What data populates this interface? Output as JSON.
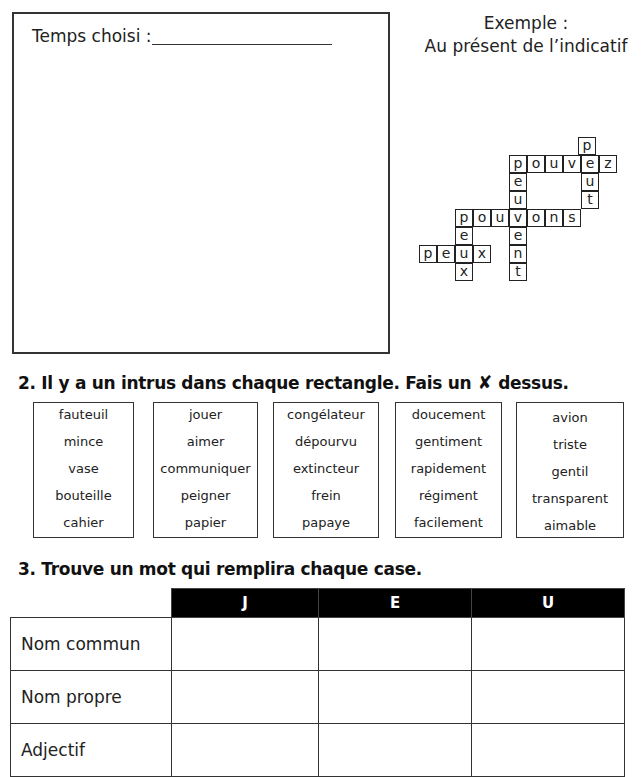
{
  "section1": {
    "tense_label": "Temps choisi :",
    "example_title": "Exemple :",
    "example_tense": "Au présent de l’indicatif",
    "crossword": {
      "cells": [
        {
          "x": 578,
          "y": 137,
          "ch": "p"
        },
        {
          "x": 509,
          "y": 155,
          "ch": "p"
        },
        {
          "x": 527,
          "y": 155,
          "ch": "o"
        },
        {
          "x": 545,
          "y": 155,
          "ch": "u"
        },
        {
          "x": 563,
          "y": 155,
          "ch": "v"
        },
        {
          "x": 581,
          "y": 155,
          "ch": "e"
        },
        {
          "x": 599,
          "y": 155,
          "ch": "z"
        },
        {
          "x": 509,
          "y": 173,
          "ch": "e"
        },
        {
          "x": 581,
          "y": 173,
          "ch": "u"
        },
        {
          "x": 509,
          "y": 191,
          "ch": "u"
        },
        {
          "x": 581,
          "y": 191,
          "ch": "t"
        },
        {
          "x": 455,
          "y": 209,
          "ch": "p"
        },
        {
          "x": 473,
          "y": 209,
          "ch": "o"
        },
        {
          "x": 491,
          "y": 209,
          "ch": "u"
        },
        {
          "x": 509,
          "y": 209,
          "ch": "v"
        },
        {
          "x": 527,
          "y": 209,
          "ch": "o"
        },
        {
          "x": 545,
          "y": 209,
          "ch": "n"
        },
        {
          "x": 563,
          "y": 209,
          "ch": "s"
        },
        {
          "x": 455,
          "y": 227,
          "ch": "e"
        },
        {
          "x": 509,
          "y": 227,
          "ch": "e"
        },
        {
          "x": 419,
          "y": 245,
          "ch": "p"
        },
        {
          "x": 437,
          "y": 245,
          "ch": "e"
        },
        {
          "x": 455,
          "y": 245,
          "ch": "u"
        },
        {
          "x": 473,
          "y": 245,
          "ch": "x"
        },
        {
          "x": 509,
          "y": 245,
          "ch": "n"
        },
        {
          "x": 455,
          "y": 263,
          "ch": "x"
        },
        {
          "x": 509,
          "y": 263,
          "ch": "t"
        }
      ],
      "words": [
        "peut",
        "pouvez",
        "peuvent",
        "pouvons",
        "peux",
        "peux"
      ]
    }
  },
  "section2": {
    "title_before": "2. Il y a un intrus dans chaque rectangle. Fais un",
    "x_symbol": "✘",
    "title_after": "dessus.",
    "boxes": [
      {
        "words": [
          "fauteuil",
          "mince",
          "vase",
          "bouteille",
          "cahier"
        ]
      },
      {
        "words": [
          "jouer",
          "aimer",
          "communiquer",
          "peigner",
          "papier"
        ]
      },
      {
        "words": [
          "congélateur",
          "dépourvu",
          "extincteur",
          "frein",
          "papaye"
        ]
      },
      {
        "words": [
          "doucement",
          "gentiment",
          "rapidement",
          "régiment",
          "facilement"
        ]
      },
      {
        "words": [
          "avion",
          "triste",
          "gentil",
          "transparent",
          "aimable"
        ]
      }
    ]
  },
  "section3": {
    "title": "3. Trouve un mot qui remplira chaque case.",
    "columns": [
      "J",
      "E",
      "U"
    ],
    "rows": [
      "Nom commun",
      "Nom propre",
      "Adjectif"
    ]
  }
}
